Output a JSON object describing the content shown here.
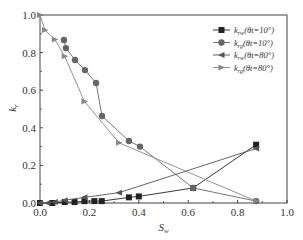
{
  "chart_data": {
    "type": "line",
    "title": "",
    "xlabel": "S_w",
    "ylabel": "k_r",
    "xlim": [
      0,
      1.0
    ],
    "ylim": [
      0,
      1.0
    ],
    "xticks": [
      "0.0",
      "0.2",
      "0.4",
      "0.6",
      "0.8",
      "1.0"
    ],
    "yticks": [
      "0.0",
      "0.2",
      "0.4",
      "0.6",
      "0.8",
      "1.0"
    ],
    "grid": false,
    "legend_position": "upper right",
    "series": [
      {
        "name": "krw(θt=10°)",
        "label_main": "k",
        "label_sub": "rw",
        "label_angle": "(θt=10°)",
        "marker": "square",
        "color": "#222222",
        "x": [
          0.0,
          0.05,
          0.1,
          0.14,
          0.18,
          0.22,
          0.25,
          0.36,
          0.4,
          0.62,
          0.875
        ],
        "y": [
          0.0,
          0.0,
          0.005,
          0.005,
          0.01,
          0.01,
          0.01,
          0.03,
          0.035,
          0.08,
          0.31
        ]
      },
      {
        "name": "krg(θt=10°)",
        "label_main": "k",
        "label_sub": "rg",
        "label_angle": "(θt=10°)",
        "marker": "circle",
        "color": "#666666",
        "x": [
          0.097,
          0.105,
          0.142,
          0.182,
          0.227,
          0.251,
          0.36,
          0.405,
          0.62,
          0.875
        ],
        "y": [
          0.867,
          0.824,
          0.761,
          0.707,
          0.638,
          0.463,
          0.33,
          0.3,
          0.08,
          0.01
        ]
      },
      {
        "name": "krw(θt=80°)",
        "label_main": "k",
        "label_sub": "rw",
        "label_angle": "(θt=80°)",
        "marker": "triangle-left",
        "color": "#555555",
        "x": [
          0.0,
          0.03,
          0.06,
          0.1,
          0.18,
          0.32,
          0.875
        ],
        "y": [
          0.0,
          0.0,
          0.005,
          0.015,
          0.03,
          0.055,
          0.29
        ]
      },
      {
        "name": "krg(θt=80°)",
        "label_main": "k",
        "label_sub": "rg",
        "label_angle": "(θt=80°)",
        "marker": "triangle-right",
        "color": "#888888",
        "x": [
          0.0,
          0.02,
          0.06,
          0.1,
          0.18,
          0.32,
          0.875
        ],
        "y": [
          1.0,
          0.92,
          0.87,
          0.78,
          0.54,
          0.32,
          0.01
        ]
      }
    ]
  }
}
